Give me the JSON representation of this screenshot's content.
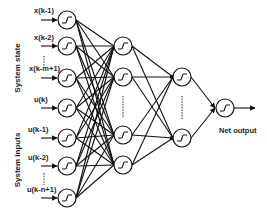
{
  "diagram": {
    "type": "neural-network",
    "group_labels": {
      "system_state": "System state",
      "system_inputs": "System inputs"
    },
    "input_labels": [
      "x(k-1)",
      "x(k-2)",
      "x(k-m+1)",
      "u(k)",
      "u(k-1)",
      "u(k-2)",
      "u(k-n+1)"
    ],
    "output_label": "Net output",
    "layers": {
      "input": {
        "x": 67,
        "nodes_y": [
          20,
          46,
          78,
          108,
          138,
          166,
          198
        ],
        "ellipsis_after": [
          1,
          5
        ]
      },
      "hidden1": {
        "x": 123,
        "nodes_y": [
          46,
          77,
          135,
          165
        ],
        "ellipsis_between": [
          1,
          2
        ]
      },
      "hidden2": {
        "x": 182,
        "nodes_y": [
          77,
          138
        ],
        "ellipsis_between": [
          0,
          1
        ]
      },
      "output": {
        "x": 225,
        "nodes_y": [
          108
        ]
      }
    },
    "node_shape": "circle-with-sigmoid",
    "colors": {
      "stroke": "#111111",
      "background": "#ffffff"
    }
  }
}
